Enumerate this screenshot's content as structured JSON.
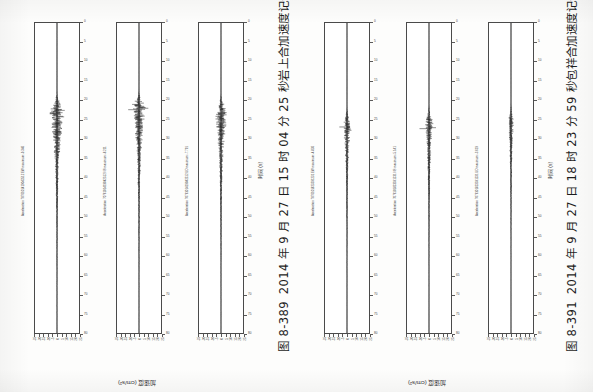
{
  "page": {
    "orientation": "rotated-90-ccw",
    "background_hex": "#fdfdfc",
    "ink_hex": "#2a2a2a"
  },
  "figures": [
    {
      "id": "figure-8-389",
      "caption_number": "图 8-389",
      "caption_text": "2014 年 9 月 27 日 15 时 04 分 25 秒岩上合加速度记录",
      "time_axis_label": "时间 (s)",
      "amplitude_axis_label": "加速度 (cm/s²)",
      "panels": [
        {
          "title": "Acceleration 7076101419042512 EW maximum:-9.346",
          "component": "EW",
          "max_value": "-9.346",
          "time_ticks": [
            0,
            5,
            10,
            15,
            20,
            25,
            30,
            35,
            40,
            45,
            50,
            55,
            60,
            65,
            70,
            75,
            80
          ],
          "time_range": [
            0,
            80
          ],
          "amp_ticks": [
            -25,
            -20,
            -15,
            -10,
            -5,
            0,
            5,
            10,
            15,
            20,
            25
          ],
          "amp_range": [
            -25,
            25
          ],
          "peak_time": 22.5,
          "peak_amp": 9.35
        },
        {
          "title": "Acceleration 7076101419042512 NS maximum:-8.211",
          "component": "NS",
          "max_value": "-8.211",
          "time_ticks": [
            0,
            5,
            10,
            15,
            20,
            25,
            30,
            35,
            40,
            45,
            50,
            55,
            60,
            65,
            70,
            75,
            80
          ],
          "time_range": [
            0,
            80
          ],
          "amp_ticks": [
            -25,
            -20,
            -15,
            -10,
            -5,
            0,
            5,
            10,
            15,
            20,
            25
          ],
          "amp_range": [
            -25,
            25
          ],
          "peak_time": 22.0,
          "peak_amp": 8.21
        },
        {
          "title": "Acceleration 7076101419042512 UD maximum:-7.791",
          "component": "UD",
          "max_value": "-7.791",
          "time_ticks": [
            0,
            5,
            10,
            15,
            20,
            25,
            30,
            35,
            40,
            45,
            50,
            55,
            60,
            65,
            70,
            75,
            80
          ],
          "time_range": [
            0,
            80
          ],
          "amp_ticks": [
            -25,
            -20,
            -15,
            -10,
            -5,
            0,
            5,
            10,
            15,
            20,
            25
          ],
          "amp_range": [
            -25,
            25
          ],
          "peak_time": 23.0,
          "peak_amp": 7.79
        }
      ]
    },
    {
      "id": "figure-8-391",
      "caption_number": "图 8-391",
      "caption_text": "2014 年 9 月 27 日 18 时 23 分 59 秒包祥合加速度记录",
      "time_axis_label": "时间 (s)",
      "amplitude_axis_label": "加速度 (cm/s²)",
      "panels": [
        {
          "title": "Acceleration 7076101823591231 EW maximum:-4.836",
          "component": "EW",
          "max_value": "-4.836",
          "time_ticks": [
            0,
            5,
            10,
            15,
            20,
            25,
            30,
            35,
            40,
            45,
            50,
            55,
            60,
            65,
            70,
            75,
            80
          ],
          "time_range": [
            0,
            80
          ],
          "amp_ticks": [
            -25,
            -20,
            -15,
            -10,
            -5,
            0,
            5,
            10,
            15,
            20,
            25
          ],
          "amp_range": [
            -25,
            25
          ],
          "peak_time": 26.0,
          "peak_amp": 4.84
        },
        {
          "title": "Acceleration 7076101823591231 NS maximum:-5.141",
          "component": "NS",
          "max_value": "-5.141",
          "time_ticks": [
            0,
            5,
            10,
            15,
            20,
            25,
            30,
            35,
            40,
            45,
            50,
            55,
            60,
            65,
            70,
            75,
            80
          ],
          "time_range": [
            0,
            80
          ],
          "amp_ticks": [
            -25,
            -20,
            -15,
            -10,
            -5,
            0,
            5,
            10,
            15,
            20,
            25
          ],
          "amp_range": [
            -25,
            25
          ],
          "peak_time": 25.5,
          "peak_amp": 5.14
        },
        {
          "title": "Acceleration 7076101823591231 UD maximum:-3.619",
          "component": "UD",
          "max_value": "-3.619",
          "time_ticks": [
            0,
            5,
            10,
            15,
            20,
            25,
            30,
            35,
            40,
            45,
            50,
            55,
            60,
            65,
            70,
            75,
            80
          ],
          "time_range": [
            0,
            80
          ],
          "amp_ticks": [
            -25,
            -20,
            -15,
            -10,
            -5,
            0,
            5,
            10,
            15,
            20,
            25
          ],
          "amp_range": [
            -25,
            25
          ],
          "peak_time": 25.0,
          "peak_amp": 3.62
        }
      ]
    }
  ],
  "chart_data": {
    "type": "line",
    "xlabel": "时间 (s)",
    "ylabel": "加速度 (cm/s²)",
    "xlim": [
      0,
      80
    ],
    "ylim": [
      -25,
      25
    ],
    "grid": false,
    "legend_position": "none",
    "xticks": [
      0,
      5,
      10,
      15,
      20,
      25,
      30,
      35,
      40,
      45,
      50,
      55,
      60,
      65,
      70,
      75,
      80
    ],
    "yticks": [
      -25,
      -20,
      -15,
      -10,
      -5,
      0,
      5,
      10,
      15,
      20,
      25
    ],
    "series": [
      {
        "name": "图8-389 EW",
        "peak_time": 22.5,
        "peak_amplitude": 9.346,
        "onset": 17.0,
        "coda_end": 42.0
      },
      {
        "name": "图8-389 NS",
        "peak_time": 22.0,
        "peak_amplitude": 8.211,
        "onset": 17.0,
        "coda_end": 42.0
      },
      {
        "name": "图8-389 UD",
        "peak_time": 23.0,
        "peak_amplitude": 7.791,
        "onset": 18.0,
        "coda_end": 40.0
      },
      {
        "name": "图8-391 EW",
        "peak_time": 26.0,
        "peak_amplitude": 4.836,
        "onset": 21.0,
        "coda_end": 44.0
      },
      {
        "name": "图8-391 NS",
        "peak_time": 25.5,
        "peak_amplitude": 5.141,
        "onset": 21.0,
        "coda_end": 44.0
      },
      {
        "name": "图8-391 UD",
        "peak_time": 25.0,
        "peak_amplitude": 3.619,
        "onset": 21.0,
        "coda_end": 42.0
      }
    ]
  }
}
